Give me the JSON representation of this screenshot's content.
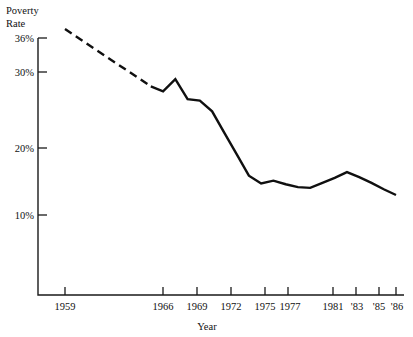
{
  "chart_data": {
    "type": "line",
    "title": "",
    "ylabel": "Poverty Rate",
    "xlabel": "Year",
    "ylim": [
      0,
      36
    ],
    "xlim": [
      1959,
      1986
    ],
    "grid": false,
    "legend": "none",
    "y_ticks": [
      {
        "value": 36,
        "label": "36%"
      },
      {
        "value": 30,
        "label": "30%"
      },
      {
        "value": 20,
        "label": "20%"
      },
      {
        "value": 10,
        "label": "10%"
      }
    ],
    "x_ticks": [
      {
        "value": 1959,
        "label": "1959"
      },
      {
        "value": 1966,
        "label": "1966"
      },
      {
        "value": 1969,
        "label": "1969"
      },
      {
        "value": 1972,
        "label": "1972"
      },
      {
        "value": 1975,
        "label": "1975"
      },
      {
        "value": 1977,
        "label": "1977"
      },
      {
        "value": 1981,
        "label": "1981"
      },
      {
        "value": 1983,
        "label": "'83"
      },
      {
        "value": 1985,
        "label": "'85"
      },
      {
        "value": 1986,
        "label": "'86"
      }
    ],
    "series": [
      {
        "name": "Poverty Rate",
        "style": "dashed",
        "note": "interpolated segment 1959-1966",
        "x": [
          1959,
          1966
        ],
        "values": [
          36.0,
          28.0
        ]
      },
      {
        "name": "Poverty Rate",
        "style": "solid",
        "note": "annual data 1966-1986",
        "x": [
          1966,
          1967,
          1968,
          1969,
          1970,
          1971,
          1972,
          1973,
          1974,
          1975,
          1976,
          1977,
          1978,
          1979,
          1980,
          1981,
          1982,
          1983,
          1984,
          1985,
          1986
        ],
        "values": [
          28.0,
          27.3,
          29.0,
          26.2,
          26.0,
          24.5,
          21.5,
          18.5,
          15.5,
          14.4,
          14.8,
          14.3,
          13.9,
          13.8,
          14.5,
          15.2,
          16.0,
          15.3,
          14.5,
          13.6,
          12.8
        ]
      }
    ]
  },
  "labels": {
    "y_axis_title_line1": "Poverty",
    "y_axis_title_line2": "Rate",
    "x_axis_title": "Year"
  }
}
